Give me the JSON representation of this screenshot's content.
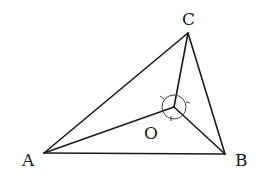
{
  "diagram": {
    "type": "geometry",
    "points": {
      "A": {
        "label": "A",
        "x": 44,
        "y": 153
      },
      "B": {
        "label": "B",
        "x": 225,
        "y": 154
      },
      "C": {
        "label": "C",
        "x": 188,
        "y": 33
      },
      "O": {
        "label": "O",
        "x": 174,
        "y": 107
      }
    },
    "segments": [
      [
        "A",
        "B"
      ],
      [
        "B",
        "C"
      ],
      [
        "C",
        "A"
      ],
      [
        "O",
        "A"
      ],
      [
        "O",
        "B"
      ],
      [
        "O",
        "C"
      ]
    ],
    "angle_marker": {
      "center": "O",
      "radius": 12,
      "ticks": 3
    },
    "labels": {
      "A": "A",
      "B": "B",
      "C": "C",
      "O": "O"
    },
    "stroke_color": "#1a1a1a"
  }
}
